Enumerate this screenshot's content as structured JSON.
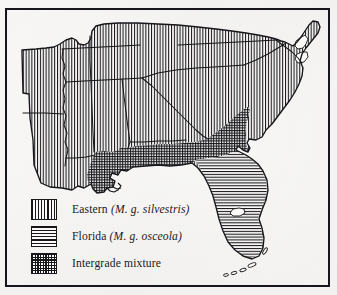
{
  "figure": {
    "kind": "distribution-map",
    "region": "Southeastern United States",
    "frame_color": "#17161a",
    "page_color": "#f4f3f1"
  },
  "legend": {
    "items": [
      {
        "id": "eastern",
        "pattern": "vertical-hatch",
        "name": "Eastern",
        "scientific": "(M. g. silvestris)",
        "swatch_name": "vertical-hatch-swatch"
      },
      {
        "id": "florida",
        "pattern": "horizontal-hatch",
        "name": "Florida",
        "scientific": "(M. g. osceola)",
        "swatch_name": "horizontal-hatch-swatch"
      },
      {
        "id": "intergrade",
        "pattern": "cross-hatch",
        "name": "Intergrade mixture",
        "scientific": "",
        "swatch_name": "cross-hatch-swatch"
      }
    ]
  },
  "map": {
    "ink_color": "#17161a",
    "land_fill": "#fbfaf8",
    "regions": [
      {
        "id": "eastern-range",
        "pattern": "vertical-hatch",
        "label": "Eastern range"
      },
      {
        "id": "florida-range",
        "pattern": "horizontal-hatch",
        "label": "Florida range"
      },
      {
        "id": "intergrade-range",
        "pattern": "cross-hatch",
        "label": "Intergrade zone"
      }
    ],
    "features": [
      {
        "id": "chesapeake-bay",
        "label": "Chesapeake Bay"
      },
      {
        "id": "delmarva-peninsula",
        "label": "Delmarva Peninsula"
      },
      {
        "id": "mississippi-delta",
        "label": "Mississippi River Delta"
      },
      {
        "id": "lake-okeechobee",
        "label": "Lake Okeechobee"
      },
      {
        "id": "florida-keys",
        "label": "Florida Keys"
      }
    ]
  }
}
